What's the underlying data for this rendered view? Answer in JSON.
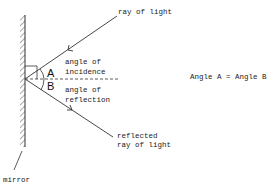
{
  "diagram": {
    "labels": {
      "incident_ray": "ray of light",
      "angle_incidence_line1": "angle of",
      "angle_incidence_line2": "incidence",
      "angle_reflection_line1": "angle of",
      "angle_reflection_line2": "reflection",
      "reflected_ray_line1": "reflected",
      "reflected_ray_line2": "ray of light",
      "mirror": "mirror",
      "angle_a": "A",
      "angle_b": "B",
      "equation": "Angle A = Angle B"
    },
    "colors": {
      "line": "#333333",
      "text": "#222222"
    }
  }
}
